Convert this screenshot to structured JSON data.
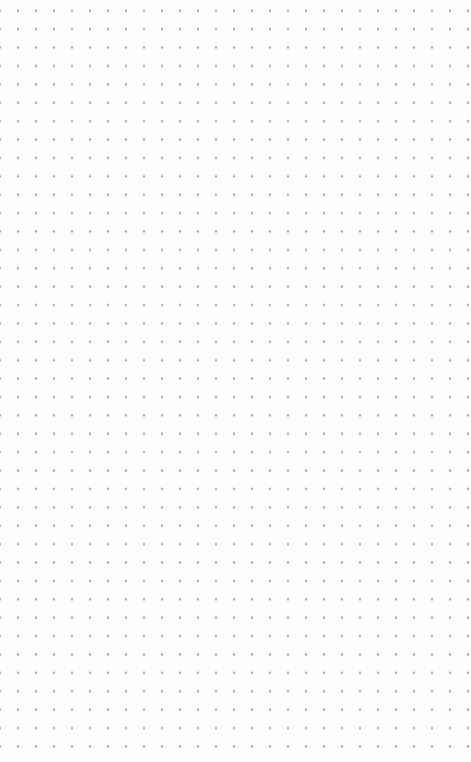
{
  "canvas": {
    "type": "dot-grid",
    "background": "#fdfdfd",
    "dot_color": "#9a9a9a",
    "columns": 25,
    "rows": 42,
    "spacing_x": 18,
    "spacing_y": 18.4
  }
}
